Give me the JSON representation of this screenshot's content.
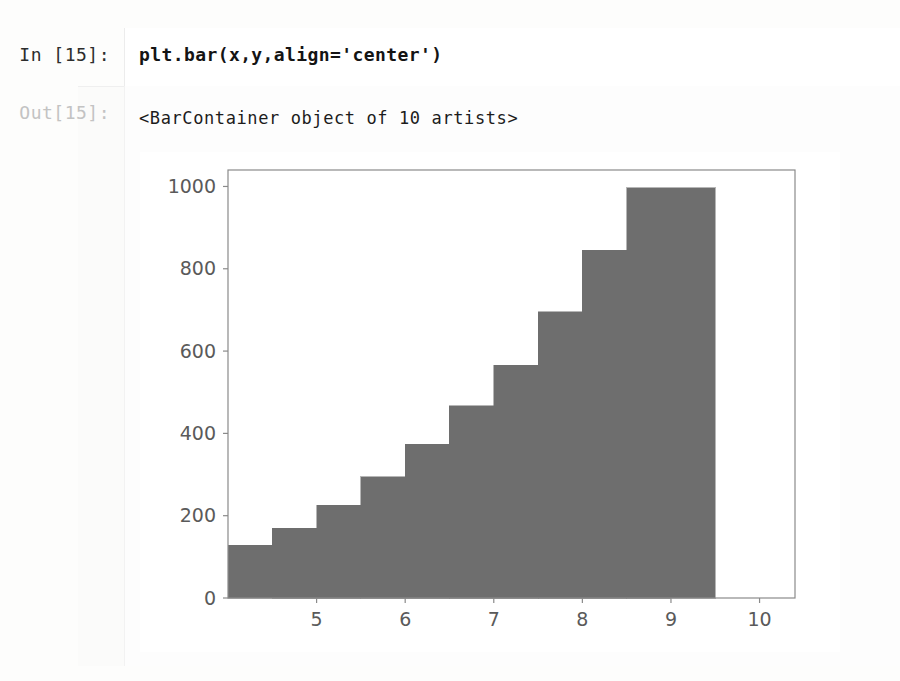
{
  "notebook": {
    "input": {
      "prompt": "In [15]:",
      "code": "plt.bar(x,y,align='center')"
    },
    "output": {
      "prompt": "Out[15]:",
      "text": "<BarContainer object of 10 artists>"
    }
  },
  "chart_data": {
    "type": "bar",
    "title": "",
    "xlabel": "",
    "ylabel": "",
    "x": [
      4.5,
      5.0,
      5.5,
      6.0,
      6.5,
      7.0,
      7.5,
      8.0,
      8.5,
      9.0
    ],
    "categories": [
      "4.5",
      "5.0",
      "5.5",
      "6.0",
      "6.5",
      "7.0",
      "7.5",
      "8.0",
      "8.5",
      "9.0"
    ],
    "values": [
      128,
      170,
      225,
      295,
      373,
      467,
      565,
      695,
      845,
      997
    ],
    "bar_width": 1.0,
    "align": "center",
    "bar_color": "#6e6e6e",
    "bar_edge_color": "#6e6e6e",
    "xlim": [
      4.0,
      10.4
    ],
    "ylim": [
      0,
      1040
    ],
    "xticks": [
      5,
      6,
      7,
      8,
      9,
      10
    ],
    "xtick_labels": [
      "5",
      "6",
      "7",
      "8",
      "9",
      "10"
    ],
    "yticks": [
      0,
      200,
      400,
      600,
      800,
      1000
    ],
    "ytick_labels": [
      "0",
      "200",
      "400",
      "600",
      "800",
      "1000"
    ],
    "grid": false,
    "legend": false,
    "frame_color": "#8a8a8a",
    "background": "#ffffff"
  }
}
